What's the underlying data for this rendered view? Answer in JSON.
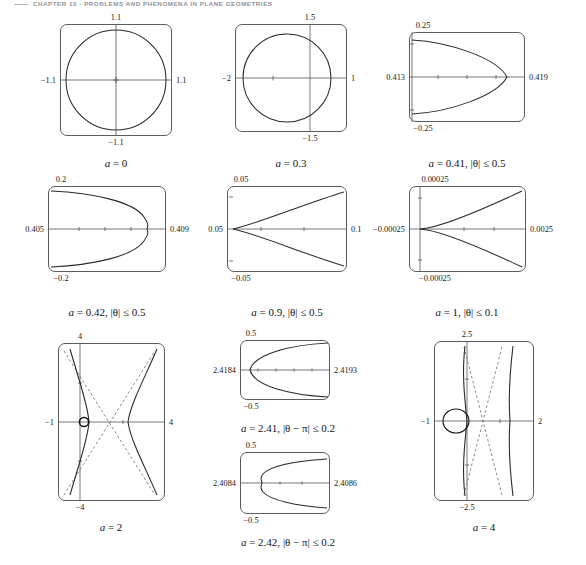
{
  "running_head": "CHAPTER 10 · PROBLEMS AND PHENOMENA IN PLANE GEOMETRIES",
  "figure": {
    "kind": "multi-panel-curve-figure",
    "panel_count": 10,
    "columns": 3,
    "stroke_color": "#2b2b30",
    "frame_color": "#5c5c60",
    "axis_color": "#55555a",
    "asymptote_color": "#6a6a70"
  },
  "panels": [
    {
      "id": "panel-a0",
      "caption": "a = 0",
      "caption_parts": {
        "var": "a",
        "eq": "= 0"
      },
      "labels": {
        "top": "1.1",
        "bottom": "−1.1",
        "left": "−1.1",
        "right": "1.1"
      },
      "axes": {
        "xmin": -1.1,
        "xmax": 1.1,
        "ymin": -1.1,
        "ymax": 1.1
      },
      "curve": "circle",
      "has_asymptotes": false,
      "has_marker": false,
      "x_axis_frac": 0.5,
      "y_axis_frac": 0.5
    },
    {
      "id": "panel-a03",
      "caption": "a = 0.3",
      "caption_parts": {
        "var": "a",
        "eq": "= 0.3"
      },
      "labels": {
        "top": "1.5",
        "bottom": "−1.5",
        "left": "−2",
        "right": "1"
      },
      "axes": {
        "xmin": -2,
        "xmax": 1,
        "ymin": -1.5,
        "ymax": 1.5
      },
      "curve": "oval-offset",
      "has_asymptotes": false,
      "has_marker": false,
      "x_axis_frac": 0.5,
      "y_axis_frac": 0.667
    },
    {
      "id": "panel-a041",
      "caption": "a = 0.41, |θ| ≤ 0.5",
      "caption_parts": {
        "var": "a",
        "eq": "= 0.41,",
        "cond": "|θ| ≤ 0.5"
      },
      "labels": {
        "top": "0.25",
        "bottom": "−0.25",
        "left": "0.413",
        "right": "0.419"
      },
      "axes": {
        "xmin": 0.413,
        "xmax": 0.419,
        "ymin": -0.25,
        "ymax": 0.25
      },
      "curve": "parabola-left",
      "has_asymptotes": false,
      "has_marker": false,
      "x_axis_frac": 0.5,
      "y_axis_frac": 0.02
    },
    {
      "id": "panel-a042",
      "caption": "a = 0.42, |θ| ≤ 0.5",
      "caption_parts": {
        "var": "a",
        "eq": "= 0.42,",
        "cond": "|θ| ≤ 0.5"
      },
      "labels": {
        "top": "0.2",
        "bottom": "−0.2",
        "left": "0.405",
        "right": "0.409"
      },
      "axes": {
        "xmin": 0.405,
        "xmax": 0.409,
        "ymin": -0.2,
        "ymax": 0.2
      },
      "curve": "parabola-left-kink",
      "has_asymptotes": false,
      "has_marker": false,
      "x_axis_frac": 0.5,
      "y_axis_frac": 0.02
    },
    {
      "id": "panel-a09",
      "caption": "a = 0.9, |θ| ≤ 0.5",
      "caption_parts": {
        "var": "a",
        "eq": "= 0.9,",
        "cond": "|θ| ≤ 0.5"
      },
      "labels": {
        "top": "0.05",
        "bottom": "−0.05",
        "left": "0.05",
        "right": "0.1"
      },
      "axes": {
        "xmin": 0.05,
        "xmax": 0.1,
        "ymin": -0.05,
        "ymax": 0.05
      },
      "curve": "wedge-right",
      "has_asymptotes": false,
      "has_marker": false,
      "x_axis_frac": 0.5,
      "y_axis_frac": 0.02
    },
    {
      "id": "panel-a1",
      "caption": "a = 1, |θ| ≤ 0.1",
      "caption_parts": {
        "var": "a",
        "eq": "= 1,",
        "cond": "|θ| ≤ 0.1"
      },
      "labels": {
        "top": "0.00025",
        "bottom": "−0.00025",
        "left": "−0.00025",
        "right": "0.0025"
      },
      "axes": {
        "xmin": -0.00025,
        "xmax": 0.0025,
        "ymin": -0.00025,
        "ymax": 0.00025
      },
      "curve": "cusp-right",
      "has_asymptotes": false,
      "has_marker": false,
      "x_axis_frac": 0.5,
      "y_axis_frac": 0.09
    },
    {
      "id": "panel-a2",
      "caption": "a = 2",
      "caption_parts": {
        "var": "a",
        "eq": "= 2"
      },
      "labels": {
        "top": "4",
        "bottom": "−4",
        "left": "−1",
        "right": "4"
      },
      "axes": {
        "xmin": -1,
        "xmax": 4,
        "ymin": -4,
        "ymax": 4
      },
      "curve": "hyperbola-pair",
      "has_asymptotes": true,
      "has_marker": true,
      "marker": "small-circle",
      "x_axis_frac": 0.5,
      "y_axis_frac": 0.2
    },
    {
      "id": "panel-a241",
      "caption": "a = 2.41, |θ − π| ≤ 0.2",
      "caption_parts": {
        "var": "a",
        "eq": "= 2.41,",
        "cond": "|θ − π| ≤ 0.2"
      },
      "labels": {
        "top": "0.5",
        "bottom": "−0.5",
        "left": "2.4184",
        "right": "2.4193"
      },
      "axes": {
        "xmin": 2.4184,
        "xmax": 2.4193,
        "ymin": -0.5,
        "ymax": 0.5
      },
      "curve": "parabola-right",
      "has_asymptotes": false,
      "has_marker": false,
      "x_axis_frac": 0.5,
      "y_axis_frac": 0.04
    },
    {
      "id": "panel-a242",
      "caption": "a = 2.42, |θ − π| ≤ 0.2",
      "caption_parts": {
        "var": "a",
        "eq": "= 2.42,",
        "cond": "|θ − π| ≤ 0.2"
      },
      "labels": {
        "top": "0.5",
        "bottom": "−0.5",
        "left": "2.4084",
        "right": "2.4086"
      },
      "axes": {
        "xmin": 2.4084,
        "xmax": 2.4086,
        "ymin": -0.5,
        "ymax": 0.5
      },
      "curve": "parabola-right-kink",
      "has_asymptotes": false,
      "has_marker": false,
      "x_axis_frac": 0.5,
      "y_axis_frac": 0.04
    },
    {
      "id": "panel-a4",
      "caption": "a = 4",
      "caption_parts": {
        "var": "a",
        "eq": "= 4"
      },
      "labels": {
        "top": "2.5",
        "bottom": "−2.5",
        "left": "−1",
        "right": "2"
      },
      "axes": {
        "xmin": -1,
        "xmax": 2,
        "ymin": -2.5,
        "ymax": 2.5
      },
      "curve": "vertical-branches",
      "has_asymptotes": true,
      "has_marker": true,
      "marker": "oval",
      "x_axis_frac": 0.5,
      "y_axis_frac": 0.33
    }
  ]
}
